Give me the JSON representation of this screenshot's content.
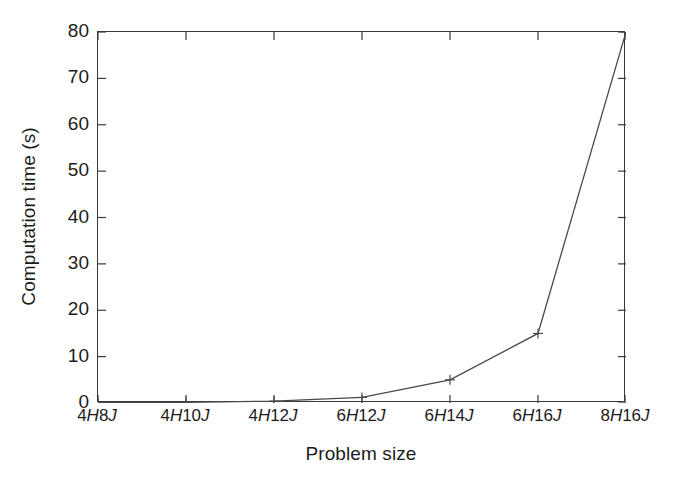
{
  "figure": {
    "background_color": "#ffffff",
    "axis_color": "#3a3a3a",
    "line_color": "#4a4a4a"
  },
  "axes": {
    "y_title": "Computation time (s)",
    "x_title": "Problem size",
    "y_ticks": [
      "0",
      "10",
      "20",
      "30",
      "40",
      "50",
      "60",
      "70",
      "80"
    ],
    "x_ticks": [
      {
        "prefix": "4",
        "mid": "H",
        "num": "8",
        "suffix": "J",
        "full": "4H8J"
      },
      {
        "prefix": "4",
        "mid": "H",
        "num": "10",
        "suffix": "J",
        "full": "4H10J"
      },
      {
        "prefix": "4",
        "mid": "H",
        "num": "12",
        "suffix": "J",
        "full": "4H12J"
      },
      {
        "prefix": "6",
        "mid": "H",
        "num": "12",
        "suffix": "J",
        "full": "6H12J"
      },
      {
        "prefix": "6",
        "mid": "H",
        "num": "14",
        "suffix": "J",
        "full": "6H14J"
      },
      {
        "prefix": "6",
        "mid": "H",
        "num": "16",
        "suffix": "J",
        "full": "6H16J"
      },
      {
        "prefix": "8",
        "mid": "H",
        "num": "16",
        "suffix": "J",
        "full": "8H16J"
      }
    ]
  },
  "chart_data": {
    "type": "line",
    "title": "",
    "xlabel": "Problem size",
    "ylabel": "Computation time (s)",
    "categories": [
      "4H8J",
      "4H10J",
      "4H12J",
      "6H12J",
      "6H14J",
      "6H16J",
      "8H16J"
    ],
    "values": [
      0.05,
      0.15,
      0.4,
      1.2,
      5.0,
      15.0,
      80.0
    ],
    "ylim": [
      0,
      80
    ],
    "ytick_interval": 10,
    "grid": false,
    "legend": null,
    "marker": "plus",
    "line_style": "solid"
  }
}
